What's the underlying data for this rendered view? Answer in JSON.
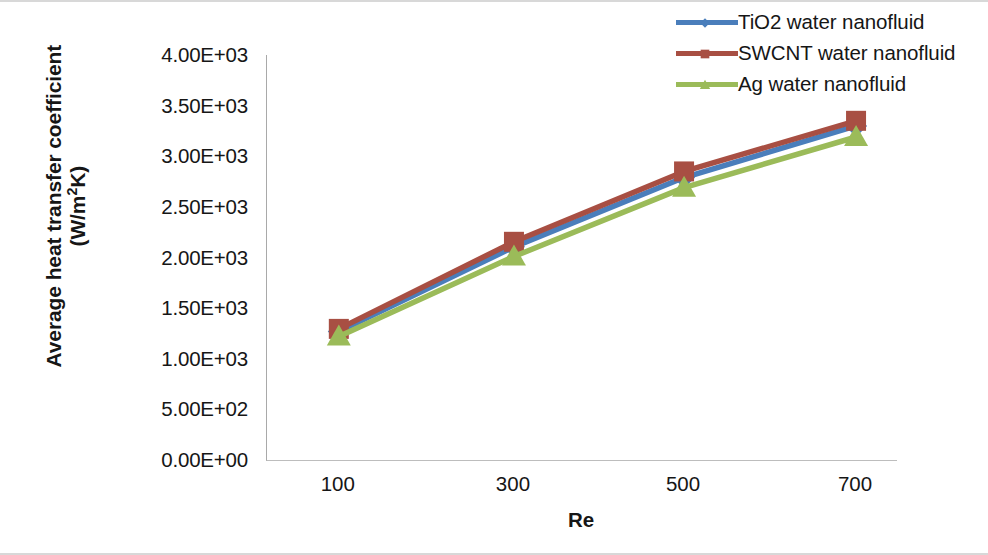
{
  "chart_data": {
    "type": "line",
    "title": "",
    "xlabel": "Re",
    "ylabel": "Average heat transfer coefficient (W/m²K)",
    "ylabel_line1": "Average heat transfer coefficient",
    "ylabel_line2_pre": "(W/m",
    "ylabel_line2_sup": "2",
    "ylabel_line2_post": "K)",
    "categories": [
      100,
      300,
      500,
      700
    ],
    "x_tick_labels": [
      "100",
      "300",
      "500",
      "700"
    ],
    "y_tick_labels": [
      "4.00E+03",
      "3.50E+03",
      "3.00E+03",
      "2.50E+03",
      "2.00E+03",
      "1.50E+03",
      "1.00E+03",
      "5.00E+02",
      "0.00E+00"
    ],
    "y_tick_values": [
      4000,
      3500,
      3000,
      2500,
      2000,
      1500,
      1000,
      500,
      0
    ],
    "ylim": [
      0,
      4000
    ],
    "xlim": [
      0,
      800
    ],
    "grid": false,
    "legend_position": "top-right",
    "series": [
      {
        "name": "TiO2 water nanofluid",
        "color": "#4a7ebb",
        "marker": "diamond",
        "values": [
          1270,
          2105,
          2790,
          3300
        ]
      },
      {
        "name": "SWCNT water nanofluid",
        "color": "#a84f43",
        "marker": "square",
        "values": [
          1295,
          2155,
          2850,
          3350
        ]
      },
      {
        "name": "Ag water nanofluid",
        "color": "#9bbb59",
        "marker": "triangle",
        "values": [
          1220,
          2010,
          2690,
          3190
        ]
      }
    ]
  },
  "legend": {
    "entries": [
      "TiO2 water nanofluid",
      "SWCNT water nanofluid",
      "Ag water nanofluid"
    ]
  }
}
